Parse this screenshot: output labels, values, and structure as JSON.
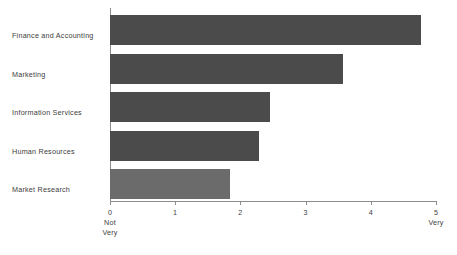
{
  "chart_data": {
    "type": "bar",
    "orientation": "horizontal",
    "title": "",
    "subtitle": "",
    "xlabel": "",
    "ylabel": "",
    "categories": [
      "Finance and Accounting",
      "Marketing",
      "Information Services",
      "Human Resources",
      "Market Research"
    ],
    "values": [
      4.77,
      3.57,
      2.45,
      2.29,
      1.84
    ],
    "xlim": [
      0,
      5
    ],
    "xticks": [
      0,
      1,
      2,
      3,
      4,
      5
    ],
    "xtick_labels": [
      "0",
      "1",
      "2",
      "3",
      "4",
      "5"
    ],
    "axis_anchors": {
      "low": "Not\nVery",
      "low_line1": "Not",
      "low_line2": "Very",
      "high": "Very"
    },
    "grid": false,
    "legend": false,
    "bar_color": "#4b4b4b",
    "axis_color": "#8c8c8c",
    "text_color": "#404040",
    "background": "#ffffff"
  },
  "bars": [
    {
      "label": "Finance and Accounting",
      "value": 4.77
    },
    {
      "label": "Marketing",
      "value": 3.57
    },
    {
      "label": "Information Services",
      "value": 2.45
    },
    {
      "label": "Human Resources",
      "value": 2.29
    },
    {
      "label": "Market Research",
      "value": 1.84
    }
  ],
  "xaxis": {
    "ticks": [
      {
        "label": "0",
        "value": 0
      },
      {
        "label": "1",
        "value": 1
      },
      {
        "label": "2",
        "value": 2
      },
      {
        "label": "3",
        "value": 3
      },
      {
        "label": "4",
        "value": 4
      },
      {
        "label": "5",
        "value": 5
      }
    ],
    "anchor_low_line1": "Not",
    "anchor_low_line2": "Very",
    "anchor_high": "Very"
  }
}
